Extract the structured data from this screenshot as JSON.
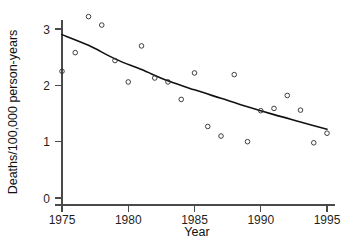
{
  "figure": {
    "background": "#ffffff",
    "marker_color": "#2b2b2b",
    "curve_color": "#111111",
    "axis_color": "#4a4a4a"
  },
  "chart_data": {
    "type": "scatter",
    "title": "",
    "xlabel": "Year",
    "ylabel": "Deaths/100,000 person-years",
    "xlim": [
      1974.3,
      1995.8
    ],
    "ylim": [
      0,
      3.4
    ],
    "xticks": [
      1975,
      1980,
      1985,
      1990,
      1995
    ],
    "xticklabels": [
      "1975",
      "1980",
      "1985",
      "1990",
      "1995"
    ],
    "yticks": [
      0,
      1,
      2,
      3
    ],
    "yticklabels": [
      "0",
      "1",
      "2",
      "3"
    ],
    "grid": false,
    "legend": null,
    "marker": "open-circle",
    "x": [
      1975,
      1976,
      1977,
      1978,
      1979,
      1980,
      1981,
      1982,
      1983,
      1984,
      1985,
      1986,
      1987,
      1988,
      1989,
      1990,
      1991,
      1992,
      1993,
      1994,
      1995
    ],
    "values": [
      2.25,
      2.58,
      3.22,
      3.07,
      2.44,
      2.06,
      2.7,
      2.13,
      2.06,
      1.75,
      2.22,
      1.27,
      1.1,
      2.19,
      1.0,
      1.55,
      1.59,
      1.82,
      1.56,
      0.98,
      1.15
    ],
    "series": [
      {
        "name": "observed-rate",
        "type": "scatter",
        "values": [
          2.25,
          2.58,
          3.22,
          3.07,
          2.44,
          2.06,
          2.7,
          2.13,
          2.06,
          1.75,
          2.22,
          1.27,
          1.1,
          2.19,
          1.0,
          1.55,
          1.59,
          1.82,
          1.56,
          0.98,
          1.15
        ]
      },
      {
        "name": "fitted-trend",
        "type": "line",
        "x": [
          1975,
          1977,
          1979,
          1981,
          1983,
          1985,
          1987,
          1989,
          1991,
          1993,
          1995
        ],
        "values": [
          2.9,
          2.71,
          2.47,
          2.28,
          2.08,
          1.92,
          1.77,
          1.62,
          1.48,
          1.35,
          1.22
        ]
      }
    ]
  }
}
